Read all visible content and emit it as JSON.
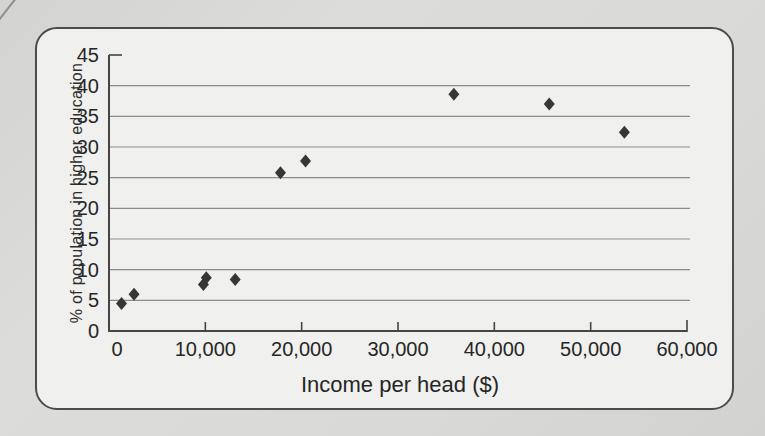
{
  "figure": {
    "page_background": "#d8d8d6",
    "panel_background": "#f0f0ee",
    "panel_border_color": "#4c4c4c"
  },
  "chart_data": {
    "type": "scatter",
    "title": "",
    "xlabel": "Income per head ($)",
    "ylabel": "% of population in higher education",
    "xlim": [
      0,
      60000
    ],
    "ylim": [
      0,
      45
    ],
    "x_ticks": [
      0,
      10000,
      20000,
      30000,
      40000,
      50000,
      60000
    ],
    "x_tick_labels": [
      "0",
      "10,000",
      "20,000",
      "30,000",
      "40,000",
      "50,000",
      "60,000"
    ],
    "y_ticks": [
      0,
      5,
      10,
      15,
      20,
      25,
      30,
      35,
      40,
      45
    ],
    "y_tick_labels": [
      "0",
      "5",
      "10",
      "15",
      "20",
      "25",
      "30",
      "35",
      "40",
      "45"
    ],
    "grid": "horizontal",
    "legend": "none",
    "marker": "diamond",
    "marker_color": "#363636",
    "gridline_color": "#8c8c8c",
    "axis_color": "#454545",
    "text_color": "#262626",
    "points": [
      {
        "x": 1300,
        "y": 4.5
      },
      {
        "x": 2600,
        "y": 6.0
      },
      {
        "x": 9800,
        "y": 7.6
      },
      {
        "x": 10100,
        "y": 8.7
      },
      {
        "x": 13100,
        "y": 8.4
      },
      {
        "x": 17800,
        "y": 25.8
      },
      {
        "x": 20400,
        "y": 27.7
      },
      {
        "x": 35800,
        "y": 38.6
      },
      {
        "x": 45700,
        "y": 37.0
      },
      {
        "x": 53500,
        "y": 32.4
      }
    ]
  }
}
